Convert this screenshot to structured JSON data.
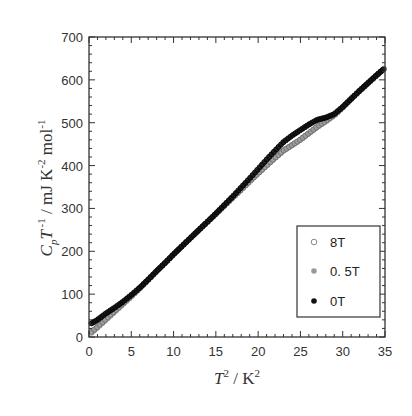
{
  "chart_data": {
    "type": "scatter",
    "title": "",
    "xlabel": "T² / K²",
    "ylabel": "CpT⁻¹ / mJ K⁻² mol⁻¹",
    "xlim": [
      0,
      35
    ],
    "ylim": [
      0,
      700
    ],
    "xticks": [
      0,
      5,
      10,
      15,
      20,
      25,
      30,
      35
    ],
    "yticks": [
      0,
      100,
      200,
      300,
      400,
      500,
      600,
      700
    ],
    "grid": false,
    "legend_position": "lower right",
    "series": [
      {
        "name": "8T",
        "marker": "open-circle",
        "color": "#888888",
        "x": [
          0.3,
          1,
          2,
          3,
          4,
          5,
          6,
          7,
          8,
          9,
          10,
          11,
          12,
          13,
          14,
          15,
          16,
          17,
          18,
          19,
          20,
          21,
          22,
          23,
          24,
          25,
          26,
          27,
          28,
          29,
          30,
          31,
          32,
          33,
          34,
          35
        ],
        "y": [
          10,
          22,
          40,
          58,
          76,
          94,
          113,
          133,
          153,
          173,
          193,
          212,
          231,
          250,
          268,
          287,
          306,
          325,
          344,
          363,
          382,
          400,
          418,
          435,
          447,
          460,
          475,
          490,
          503,
          517,
          535,
          555,
          574,
          592,
          610,
          628
        ]
      },
      {
        "name": "0.5T",
        "marker": "gray-circle",
        "color": "#999999",
        "x": [
          0.3,
          1,
          2,
          3,
          4,
          5,
          6,
          7,
          8,
          9,
          10,
          11,
          12,
          13,
          14,
          15,
          16,
          17,
          18,
          19,
          20,
          21,
          22,
          23,
          24,
          25,
          26,
          27,
          28,
          29,
          30,
          31,
          32,
          33,
          34,
          35
        ],
        "y": [
          12,
          24,
          42,
          60,
          78,
          96,
          114,
          134,
          154,
          173,
          193,
          212,
          231,
          250,
          268,
          287,
          306,
          325,
          344,
          363,
          382,
          400,
          418,
          435,
          448,
          461,
          476,
          491,
          504,
          518,
          536,
          555,
          574,
          592,
          610,
          628
        ]
      },
      {
        "name": "0T",
        "marker": "filled-circle",
        "color": "#111111",
        "x": [
          0.3,
          1,
          2,
          3,
          4,
          5,
          6,
          7,
          8,
          9,
          10,
          11,
          12,
          13,
          14,
          15,
          16,
          17,
          18,
          19,
          20,
          21,
          22,
          23,
          24,
          25,
          26,
          27,
          28,
          29,
          30,
          31,
          32,
          33,
          34,
          35
        ],
        "y": [
          32,
          40,
          55,
          68,
          82,
          98,
          115,
          134,
          154,
          173,
          193,
          212,
          231,
          250,
          269,
          288,
          308,
          328,
          349,
          370,
          392,
          414,
          435,
          455,
          470,
          483,
          496,
          507,
          512,
          520,
          537,
          556,
          575,
          593,
          611,
          628
        ]
      }
    ]
  },
  "legend": {
    "items": [
      {
        "label": "8T",
        "marker": "open"
      },
      {
        "label": "0. 5T",
        "marker": "gray"
      },
      {
        "label": "0T",
        "marker": "filled"
      }
    ]
  },
  "axes": {
    "x_title_main": "T",
    "x_title_sup": "2",
    "x_title_rest": " / K",
    "x_title_sup2": "2",
    "y_title_C": "C",
    "y_title_sub": "p",
    "y_title_T": "T",
    "y_title_sup": " -1",
    "y_title_rest": " / mJ K",
    "y_title_sup2": "-2",
    "y_title_rest2": " mol",
    "y_title_sup3": "-1"
  }
}
